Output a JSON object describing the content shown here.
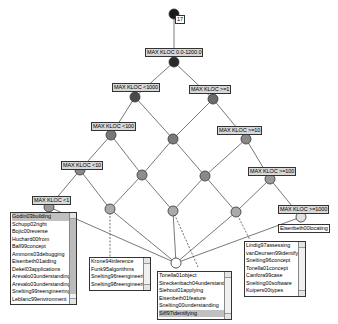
{
  "diagram": {
    "type": "concept-lattice",
    "top_count": "17",
    "nodes": [
      {
        "id": "top",
        "label": "",
        "count": "17"
      },
      {
        "id": "n0",
        "label": "MAX KLOC 0.0-1200.0"
      },
      {
        "id": "n1",
        "label": "MAX KLOC <1000"
      },
      {
        "id": "n2",
        "label": "MAX KLOC >=1"
      },
      {
        "id": "n3",
        "label": "MAX KLOC <100"
      },
      {
        "id": "n4",
        "label": "MAX KLOC >=10"
      },
      {
        "id": "n5",
        "label": "MAX KLOC <10"
      },
      {
        "id": "n6",
        "label": "MAX KLOC >=100"
      },
      {
        "id": "n7",
        "label": "MAX KLOC <1"
      },
      {
        "id": "n8",
        "label": "MAX KLOC >=1000"
      },
      {
        "id": "bottom",
        "label": ""
      }
    ],
    "extent_label_n8": "Eisenbeth00locating",
    "lists": {
      "n7": {
        "items": [
          "Godin03building",
          "Schupp02right",
          "Bojic00reverse",
          "Huchard00from",
          "Ball99concept",
          "Ammons03debugging",
          "Eisenbeth01aiding",
          "Dekel03applications",
          "Arevalo03understanding-s",
          "Arevalo03understanding-a",
          "Snelting99reengineering",
          "Leblanc99environment"
        ]
      },
      "n5_child": {
        "items": [
          "Krone94inference",
          "Funk95algorithms",
          "Snelting96reengineering",
          "Snelting98reengineering"
        ]
      },
      "bottom": {
        "items": [
          "Tonella01object",
          "Streckenbach04understanding",
          "Siehout01applying",
          "Eisenbeth01feature",
          "Snelting00understanding",
          "Siff97identifying"
        ]
      },
      "n6_child": {
        "items": [
          "Lindig97assessing",
          "vanDeursen99identifying",
          "Snelting96concept",
          "Tonella01concept",
          "Canfora99case",
          "Snelting00software",
          "Kuipers00types"
        ]
      }
    }
  }
}
